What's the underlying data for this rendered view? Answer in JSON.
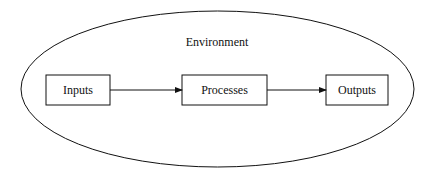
{
  "diagram": {
    "container": {
      "label": "Environment",
      "shape": "ellipse"
    },
    "nodes": [
      {
        "id": "inputs",
        "label": "Inputs"
      },
      {
        "id": "processes",
        "label": "Processes"
      },
      {
        "id": "outputs",
        "label": "Outputs"
      }
    ],
    "edges": [
      {
        "from": "inputs",
        "to": "processes"
      },
      {
        "from": "processes",
        "to": "outputs"
      }
    ],
    "colors": {
      "stroke": "#111111",
      "background": "#ffffff"
    }
  }
}
